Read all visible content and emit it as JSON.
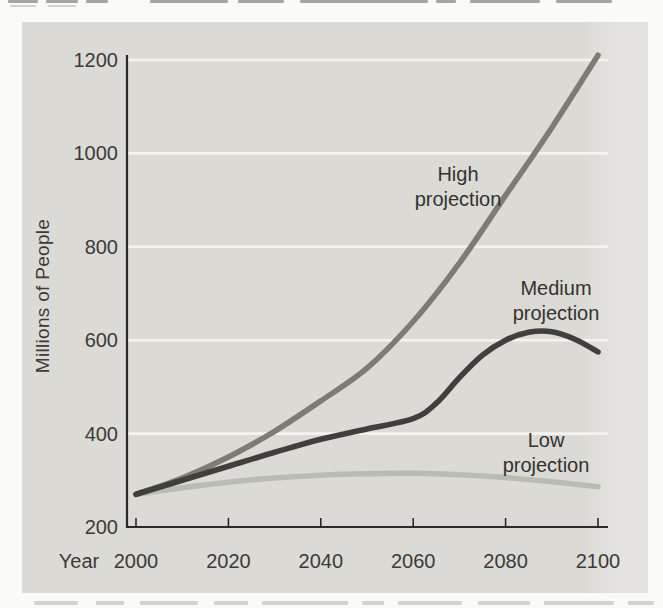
{
  "figure": {
    "kind": "scanned textbook chart figure",
    "panel_color": "#dcdad5",
    "page_color": "#fafaf7"
  },
  "chart_data": {
    "type": "line",
    "title": "",
    "xlabel": "Year",
    "ylabel": "Millions of People",
    "xlim": [
      2000,
      2100
    ],
    "ylim": [
      200,
      1200
    ],
    "x_ticks": [
      2000,
      2020,
      2040,
      2060,
      2080,
      2100
    ],
    "y_ticks": [
      200,
      400,
      600,
      800,
      1000,
      1200
    ],
    "grid": "horizontal white gridlines on gray panel",
    "legend": "inline labels beside each curve",
    "axis_color": "#2b2a28",
    "gridline_color": "#f4f3ef",
    "series": [
      {
        "id": "high-projection",
        "name": "High projection",
        "color": "#7e7b75",
        "x": [
          2000,
          2010,
          2020,
          2030,
          2040,
          2050,
          2060,
          2070,
          2080,
          2090,
          2100
        ],
        "values": [
          270,
          305,
          350,
          405,
          470,
          540,
          640,
          765,
          910,
          1055,
          1210
        ]
      },
      {
        "id": "medium-projection",
        "name": "Medium projection",
        "color": "#413f3c",
        "x": [
          2000,
          2010,
          2020,
          2030,
          2040,
          2050,
          2060,
          2065,
          2070,
          2075,
          2080,
          2085,
          2090,
          2095,
          2100
        ],
        "values": [
          270,
          300,
          330,
          360,
          388,
          410,
          432,
          465,
          520,
          568,
          600,
          617,
          618,
          602,
          575
        ]
      },
      {
        "id": "low-projection",
        "name": "Low projection",
        "color": "#b9bcb0",
        "x": [
          2000,
          2010,
          2020,
          2030,
          2040,
          2050,
          2060,
          2070,
          2080,
          2090,
          2100
        ],
        "values": [
          270,
          284,
          296,
          305,
          311,
          314,
          315,
          312,
          306,
          297,
          286
        ]
      }
    ],
    "annotations": [
      {
        "series": "high-projection",
        "lines": [
          "High",
          "projection"
        ],
        "anchor_px": {
          "x": 458,
          "y": 187
        }
      },
      {
        "series": "medium-projection",
        "lines": [
          "Medium",
          "projection"
        ],
        "anchor_px": {
          "x": 556,
          "y": 301
        }
      },
      {
        "series": "low-projection",
        "lines": [
          "Low",
          "projection"
        ],
        "anchor_px": {
          "x": 546,
          "y": 453
        }
      }
    ]
  }
}
